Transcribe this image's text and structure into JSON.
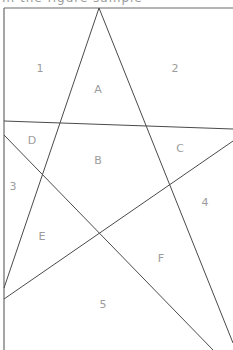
{
  "caption": "In the figure sample",
  "figure": {
    "line_color": "#4a4a4a",
    "label_color": "#9c9c9c",
    "apex": {
      "x": 99,
      "y": 8
    },
    "regions": [
      {
        "label": "1",
        "x": 40,
        "y": 69
      },
      {
        "label": "2",
        "x": 175,
        "y": 69
      },
      {
        "label": "A",
        "x": 98,
        "y": 90
      },
      {
        "label": "D",
        "x": 32,
        "y": 141
      },
      {
        "label": "B",
        "x": 98,
        "y": 161
      },
      {
        "label": "C",
        "x": 180,
        "y": 149
      },
      {
        "label": "3",
        "x": 13,
        "y": 187
      },
      {
        "label": "4",
        "x": 205,
        "y": 203
      },
      {
        "label": "E",
        "x": 42,
        "y": 237
      },
      {
        "label": "F",
        "x": 161,
        "y": 259
      },
      {
        "label": "5",
        "x": 103,
        "y": 305
      }
    ]
  }
}
